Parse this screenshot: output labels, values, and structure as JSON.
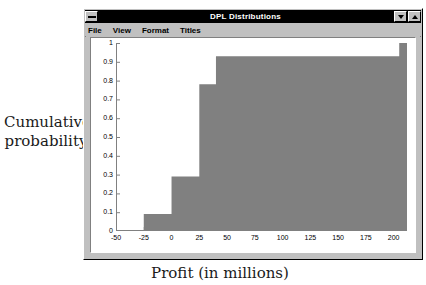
{
  "window": {
    "title": "DPL Distributions",
    "sysmenu_icon": "system-menu-icon",
    "minimize_icon": "minimize-icon",
    "maximize_icon": "maximize-icon",
    "menus": [
      {
        "label": "File",
        "accel": "F"
      },
      {
        "label": "View",
        "accel": "V"
      },
      {
        "label": "Format",
        "accel": "o"
      },
      {
        "label": "Titles",
        "accel": "T"
      }
    ]
  },
  "axis_titles": {
    "y_line1": "Cumulative",
    "y_line2": "probability",
    "x": "Profit (in millions)"
  },
  "colors": {
    "fill": "#808080",
    "plot_background": "#ffffff",
    "window_face": "#c0c0c0",
    "titlebar": "#000000",
    "axis": "#808080"
  },
  "chart_data": {
    "type": "area",
    "title": "DPL Distributions",
    "xlabel": "Profit (in millions)",
    "ylabel": "Cumulative probability",
    "xlim": [
      -50,
      212
    ],
    "ylim": [
      0,
      1
    ],
    "xticks": [
      -50,
      -25,
      0,
      25,
      50,
      75,
      100,
      125,
      150,
      175,
      200
    ],
    "xtick_labels": [
      "-50",
      "-25",
      "0",
      "25",
      "50",
      "75",
      "100",
      "125",
      "150",
      "175",
      "200"
    ],
    "yticks": [
      0,
      0.1,
      0.2,
      0.3,
      0.4,
      0.5,
      0.6,
      0.7,
      0.8,
      0.9,
      1
    ],
    "ytick_labels": [
      "0",
      "0.1",
      "0.2",
      "0.3",
      "0.4",
      "0.5",
      "0.6",
      "0.7",
      "0.8",
      "0.9",
      "1"
    ],
    "grid": false,
    "legend": null,
    "step_points": [
      {
        "x": -50,
        "y": 0
      },
      {
        "x": -25,
        "y": 0.09
      },
      {
        "x": 0,
        "y": 0.29
      },
      {
        "x": 25,
        "y": 0.78
      },
      {
        "x": 40,
        "y": 0.93
      },
      {
        "x": 205,
        "y": 1.0
      },
      {
        "x": 212,
        "y": 1.0
      }
    ],
    "series": [
      {
        "name": "Cumulative distribution",
        "x": [
          -50,
          -25,
          0,
          25,
          40,
          205,
          212
        ],
        "values": [
          0,
          0.09,
          0.29,
          0.78,
          0.93,
          1.0,
          1.0
        ]
      }
    ]
  }
}
